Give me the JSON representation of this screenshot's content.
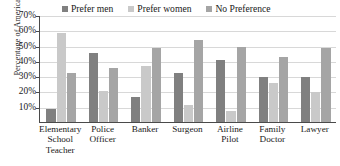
{
  "chart_data": {
    "type": "bar",
    "title": "",
    "xlabel": "",
    "ylabel": "Percentage of Americans",
    "ylim": [
      0,
      70
    ],
    "ytick_labels": [
      "70%",
      "60%",
      "50%",
      "40%",
      "30%",
      "20%",
      "10%"
    ],
    "ytick_values": [
      70,
      60,
      50,
      40,
      30,
      20,
      10
    ],
    "grid": true,
    "legend_position": "top",
    "categories": [
      "Elementary School Teacher",
      "Police Officer",
      "Banker",
      "Surgeon",
      "Airline Pilot",
      "Family Doctor",
      "Lawyer"
    ],
    "category_lines": [
      [
        "Elementary",
        "School",
        "Teacher"
      ],
      [
        "Police",
        "Officer"
      ],
      [
        "Banker"
      ],
      [
        "Surgeon"
      ],
      [
        "Airline",
        "Pilot"
      ],
      [
        "Family",
        "Doctor"
      ],
      [
        "Lawyer"
      ]
    ],
    "series": [
      {
        "name": "Prefer men",
        "color": "#808080",
        "values": [
          9,
          46,
          17,
          33,
          41,
          30,
          30
        ]
      },
      {
        "name": "Prefer women",
        "color": "#c9c9c9",
        "values": [
          59,
          21,
          37,
          12,
          8,
          26,
          20
        ]
      },
      {
        "name": "No Preference",
        "color": "#a5a5a5",
        "values": [
          33,
          36,
          49,
          54,
          50,
          43,
          49
        ]
      }
    ]
  },
  "axis": {
    "y_title": "Percentage of Americans"
  },
  "legend": {
    "items": [
      {
        "label": "Prefer men",
        "color": "#808080"
      },
      {
        "label": "Prefer women",
        "color": "#c9c9c9"
      },
      {
        "label": "No Preference",
        "color": "#a5a5a5"
      }
    ]
  }
}
